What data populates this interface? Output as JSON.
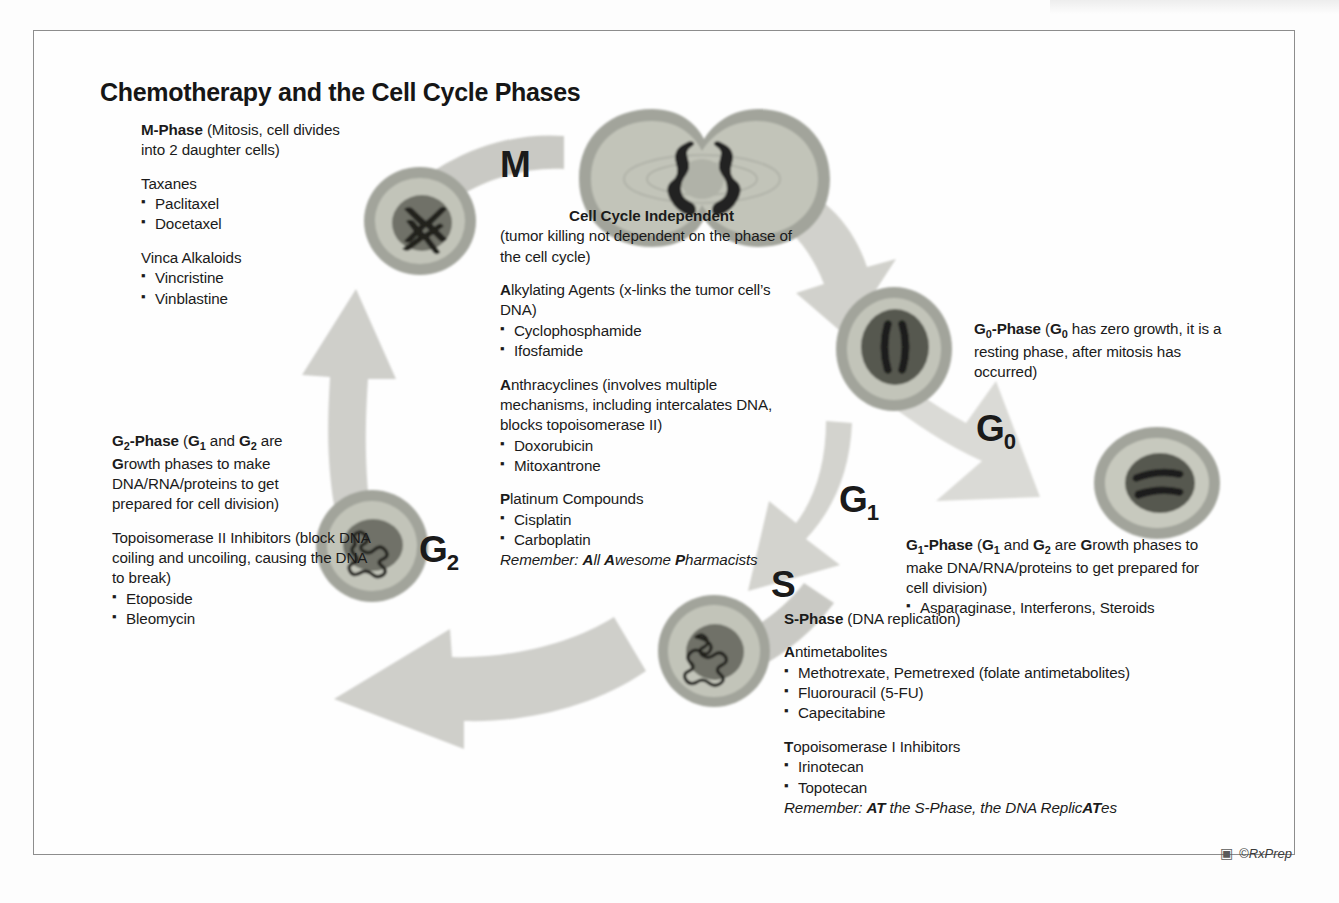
{
  "page": {
    "title": "Chemotherapy and the Cell Cycle Phases",
    "credit": "©RxPrep",
    "credit_icon": "camera-icon"
  },
  "colors": {
    "arrow_fill": "#c9c9c4",
    "arrow_fill_light": "#d6d6d1",
    "cell_membrane": "#a2a49b",
    "cytoplasm": "#c2c4b9",
    "nucleus": "#6f7168",
    "chromatin": "#2b2b28",
    "text": "#1b1b1b",
    "frame_border": "#8d8d8d"
  },
  "cycle_labels": [
    {
      "name": "M",
      "letter": "M",
      "sub": ""
    },
    {
      "name": "G0",
      "letter": "G",
      "sub": "0"
    },
    {
      "name": "G1",
      "letter": "G",
      "sub": "1"
    },
    {
      "name": "S",
      "letter": "S",
      "sub": ""
    },
    {
      "name": "G2",
      "letter": "G",
      "sub": "2"
    }
  ],
  "blocks": {
    "m_phase": {
      "heading_bold": "M-Phase",
      "heading_rest": " (Mitosis, cell divides into 2 daughter cells)",
      "groups": [
        {
          "title": "Taxanes",
          "title_bold_first": 0,
          "items": [
            "Paclitaxel",
            "Docetaxel"
          ]
        },
        {
          "title": "Vinca Alkaloids",
          "title_bold_first": 0,
          "items": [
            "Vincristine",
            "Vinblastine"
          ]
        }
      ]
    },
    "cell_cycle_independent": {
      "heading": "Cell Cycle Independent",
      "subheading": "(tumor killing not dependent on the phase of the cell cycle)",
      "groups": [
        {
          "bold_prefix": "A",
          "title_rest": "lkylating Agents (x-links the tumor cell’s DNA)",
          "items": [
            "Cyclophosphamide",
            "Ifosfamide"
          ]
        },
        {
          "bold_prefix": "A",
          "title_rest": "nthracyclines (involves multiple mechanisms, including intercalates DNA, blocks topoisomerase II)",
          "items": [
            "Doxorubicin",
            "Mitoxantrone"
          ]
        },
        {
          "bold_prefix": "P",
          "title_rest": "latinum Compounds",
          "items": [
            "Cisplatin",
            "Carboplatin"
          ]
        }
      ],
      "remember_label": "Remember: ",
      "remember_parts": [
        {
          "bold": "A",
          "rest": "ll "
        },
        {
          "bold": "A",
          "rest": "wesome "
        },
        {
          "bold": "P",
          "rest": "harmacists"
        }
      ]
    },
    "g0_phase": {
      "heading_bold": "G",
      "heading_sub": "0",
      "heading_dash": "-Phase",
      "rest_pre": " (",
      "rest_bold": "G",
      "rest_sub": "0",
      "rest_post": " has zero growth, it is a resting phase, after mitosis has occurred)"
    },
    "g1_phase": {
      "heading": "G₁-Phase (G₁ and G₂ are Growth phases to make DNA/RNA/proteins to get prepared for cell division)",
      "items": [
        "Asparaginase, Interferons, Steroids"
      ]
    },
    "g2_phase": {
      "heading": "G₂-Phase (G₁ and G₂ are Growth phases to make DNA/RNA/proteins to get prepared for cell division)",
      "group": {
        "bold_prefix": "T",
        "title_rest": "opoisomerase II Inhibitors (block DNA coiling and uncoiling, causing the DNA to break)",
        "title_plain": "Topoisomerase II Inhibitors (block DNA coiling and uncoiling, causing the DNA to break)",
        "items": [
          "Etoposide",
          "Bleomycin"
        ]
      }
    },
    "s_phase": {
      "heading_bold": "S-Phase",
      "heading_rest": " (DNA replication)",
      "groups": [
        {
          "bold_prefix": "A",
          "title_rest": "ntimetabolites",
          "items": [
            "Methotrexate, Pemetrexed (folate antimetabolites)",
            "Fluorouracil (5-FU)",
            "Capecitabine"
          ]
        },
        {
          "bold_prefix": "T",
          "title_rest": "opoisomerase I Inhibitors",
          "items": [
            "Irinotecan",
            "Topotecan"
          ]
        }
      ],
      "remember_label": "Remember: ",
      "remember_at": "AT",
      "remember_mid": " the S-Phase, the DNA Replic",
      "remember_at2": "AT",
      "remember_end": "es"
    }
  },
  "cells": [
    {
      "name": "cell-m-chromosomes",
      "desc": "round cell with paired X chromosomes (metaphase)"
    },
    {
      "name": "cell-dividing",
      "desc": "dumbbell-shaped dividing cell, two chromatin masses"
    },
    {
      "name": "cell-g1",
      "desc": "round cell with two rod chromatin bodies"
    },
    {
      "name": "cell-g0-resting",
      "desc": "round resting cell with wavy chromatin"
    },
    {
      "name": "cell-s-phase",
      "desc": "round cell with tangled replicating DNA"
    },
    {
      "name": "cell-g2",
      "desc": "round cell with condensed coiled chromatin"
    }
  ]
}
